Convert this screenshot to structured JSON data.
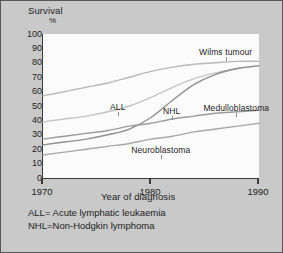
{
  "chart_data": {
    "type": "line",
    "title": "",
    "ylabel": "Survival",
    "ylabel_unit": "%",
    "xlabel": "Year of diagnosis",
    "xlim": [
      1970,
      1990
    ],
    "ylim": [
      0,
      100
    ],
    "ytick_labels": [
      "100",
      "90",
      "80",
      "70",
      "60",
      "50",
      "40",
      "30",
      "20",
      "10",
      "0"
    ],
    "ytick_values": [
      100,
      90,
      80,
      70,
      60,
      50,
      40,
      30,
      20,
      10,
      0
    ],
    "xtick_labels": [
      "1970",
      "1980",
      "1990"
    ],
    "xtick_values": [
      1970,
      1980,
      1990
    ],
    "grid": false,
    "legend_position": "inline-labels",
    "series": [
      {
        "name": "Wilms tumour",
        "label": "Wilms tumour",
        "color": "#b9b9b9",
        "x": [
          1970,
          1972,
          1974,
          1976,
          1978,
          1980,
          1982,
          1984,
          1986,
          1988,
          1990
        ],
        "values": [
          57,
          60,
          63,
          66,
          70,
          74,
          77,
          79,
          80,
          81,
          81
        ]
      },
      {
        "name": "ALL",
        "label": "ALL",
        "color": "#c4c4c4",
        "x": [
          1970,
          1972,
          1974,
          1976,
          1978,
          1980,
          1982,
          1984,
          1986,
          1988,
          1990
        ],
        "values": [
          39,
          41,
          43,
          46,
          50,
          56,
          63,
          69,
          73,
          76,
          78
        ]
      },
      {
        "name": "NHL",
        "label": "NHL",
        "color": "#8f8f8f",
        "x": [
          1970,
          1972,
          1974,
          1976,
          1978,
          1980,
          1982,
          1984,
          1986,
          1988,
          1990
        ],
        "values": [
          23,
          25,
          27,
          30,
          34,
          42,
          54,
          65,
          72,
          76,
          78
        ]
      },
      {
        "name": "Medulloblastoma",
        "label": "Medulloblastoma",
        "color": "#9a9a9a",
        "x": [
          1970,
          1972,
          1974,
          1976,
          1978,
          1980,
          1982,
          1984,
          1986,
          1988,
          1990
        ],
        "values": [
          27,
          29,
          31,
          33,
          36,
          38,
          41,
          43,
          45,
          46,
          47
        ]
      },
      {
        "name": "Neuroblastoma",
        "label": "Neuroblastoma",
        "color": "#a8a8a8",
        "x": [
          1970,
          1972,
          1974,
          1976,
          1978,
          1980,
          1982,
          1984,
          1986,
          1988,
          1990
        ],
        "values": [
          16,
          18,
          20,
          22,
          24,
          27,
          29,
          32,
          34,
          36,
          38
        ]
      }
    ],
    "annotations": [
      {
        "text": "Wilms tumour",
        "x": 1987,
        "y": 91
      },
      {
        "text": "ALL",
        "x": 1977,
        "y": 53
      },
      {
        "text": "NHL",
        "x": 1982,
        "y": 50
      },
      {
        "text": "Medulloblastoma",
        "x": 1988,
        "y": 52
      },
      {
        "text": "Neuroblastoma",
        "x": 1981,
        "y": 23
      }
    ]
  },
  "footnotes": [
    "ALL= Acute lymphatic leukaemia",
    "NHL=Non-Hodgkin lymphoma"
  ],
  "colors": {
    "figure_background": "#c9c9c9",
    "plot_background": "#fbfbfb",
    "axis": "#3a3a3a",
    "border": "#575757",
    "text": "#1d1d1d"
  }
}
